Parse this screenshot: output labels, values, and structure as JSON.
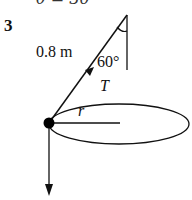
{
  "figure": {
    "partial_top_text": "θ = 30°",
    "question_number": "3",
    "string_length_label": "0.8 m",
    "angle_label": "60°",
    "tension_label": "T",
    "radius_label": "r"
  },
  "colors": {
    "ink": "#111111",
    "background": "#ffffff"
  }
}
